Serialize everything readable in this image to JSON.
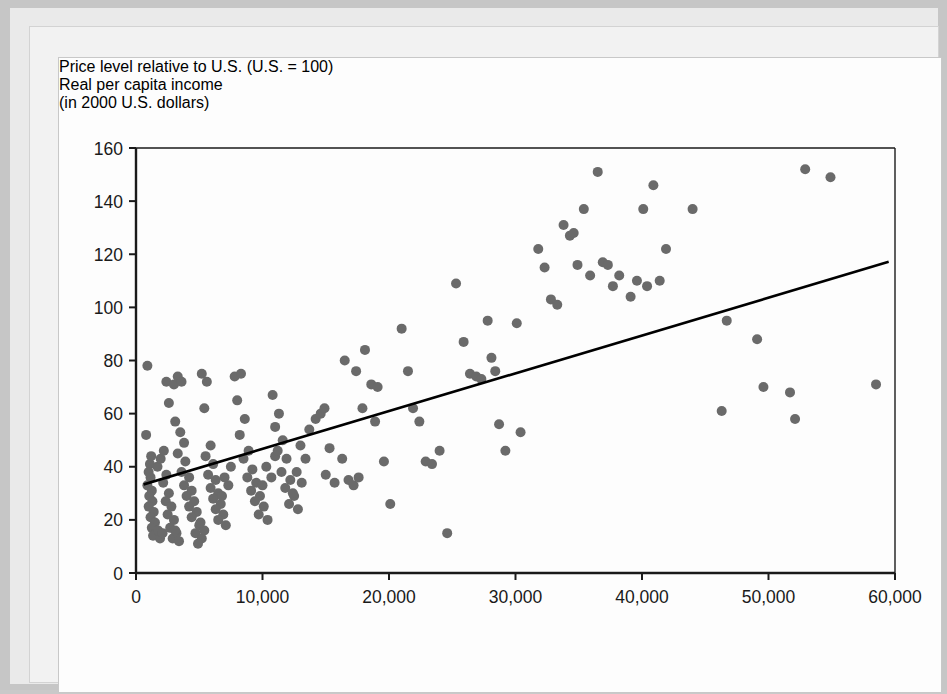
{
  "figure": {
    "y_axis_title": "Price level relative to U.S. (U.S. = 100)",
    "x_axis_title_line1": "Real per capita income",
    "x_axis_title_line2": "(in 2000 U.S. dollars)"
  },
  "colors": {
    "point_fill": "#6a6a6a",
    "axis": "#1a1a1a",
    "trendline": "#000000",
    "panel_background": "#fdfdfd",
    "mat_background": "#eaeaea",
    "outer_background": "#c6c6c6"
  },
  "chart_data": {
    "type": "scatter",
    "title": "",
    "subtitle": "",
    "xlabel": "Real per capita income (in 2000 U.S. dollars)",
    "ylabel": "Price level relative to U.S. (U.S. = 100)",
    "xlim": [
      0,
      60000
    ],
    "ylim": [
      0,
      160
    ],
    "xticks": [
      0,
      10000,
      20000,
      30000,
      40000,
      50000,
      60000
    ],
    "xtick_labels": [
      "0",
      "10,000",
      "20,000",
      "30,000",
      "40,000",
      "50,000",
      "60,000"
    ],
    "yticks": [
      0,
      20,
      40,
      60,
      80,
      100,
      120,
      140,
      160
    ],
    "ytick_labels": [
      "0",
      "20",
      "40",
      "60",
      "80",
      "100",
      "120",
      "140",
      "160"
    ],
    "grid": false,
    "legend": null,
    "marker": {
      "shape": "circle",
      "size_px": 10,
      "color": "#6a6a6a"
    },
    "trendline": {
      "type": "linear",
      "x": [
        700,
        59400
      ],
      "y": [
        33.5,
        117.0
      ],
      "color": "#000000",
      "width_px": 2.6
    },
    "points": [
      [
        900,
        78
      ],
      [
        800,
        52
      ],
      [
        1100,
        41
      ],
      [
        1200,
        44
      ],
      [
        1000,
        38
      ],
      [
        1150,
        36
      ],
      [
        900,
        33
      ],
      [
        1250,
        31
      ],
      [
        1050,
        29
      ],
      [
        1300,
        27
      ],
      [
        1000,
        25
      ],
      [
        1400,
        23
      ],
      [
        1150,
        21
      ],
      [
        1500,
        19
      ],
      [
        1250,
        17
      ],
      [
        1600,
        15
      ],
      [
        1350,
        14
      ],
      [
        1750,
        16
      ],
      [
        1900,
        13
      ],
      [
        2100,
        15
      ],
      [
        1700,
        40
      ],
      [
        1950,
        43
      ],
      [
        2200,
        46
      ],
      [
        2400,
        37
      ],
      [
        2150,
        34
      ],
      [
        2600,
        30
      ],
      [
        2350,
        27
      ],
      [
        2800,
        25
      ],
      [
        2500,
        22
      ],
      [
        3000,
        20
      ],
      [
        2700,
        17
      ],
      [
        3200,
        15
      ],
      [
        2900,
        13
      ],
      [
        3400,
        12
      ],
      [
        3100,
        16
      ],
      [
        2600,
        64
      ],
      [
        2400,
        72
      ],
      [
        3000,
        71
      ],
      [
        3300,
        74
      ],
      [
        3600,
        72
      ],
      [
        3100,
        57
      ],
      [
        3500,
        53
      ],
      [
        3800,
        49
      ],
      [
        3300,
        45
      ],
      [
        3900,
        42
      ],
      [
        3600,
        38
      ],
      [
        4200,
        36
      ],
      [
        3800,
        33
      ],
      [
        4400,
        31
      ],
      [
        4000,
        29
      ],
      [
        4600,
        27
      ],
      [
        4200,
        25
      ],
      [
        4800,
        23
      ],
      [
        4400,
        21
      ],
      [
        5000,
        18
      ],
      [
        4700,
        15
      ],
      [
        5200,
        13
      ],
      [
        4900,
        11
      ],
      [
        5400,
        16
      ],
      [
        5100,
        19
      ],
      [
        5200,
        75
      ],
      [
        5600,
        72
      ],
      [
        5400,
        62
      ],
      [
        5900,
        48
      ],
      [
        5500,
        44
      ],
      [
        6100,
        41
      ],
      [
        5700,
        37
      ],
      [
        6300,
        35
      ],
      [
        5900,
        32
      ],
      [
        6500,
        30
      ],
      [
        6100,
        28
      ],
      [
        6700,
        26
      ],
      [
        6300,
        24
      ],
      [
        6900,
        22
      ],
      [
        6500,
        20
      ],
      [
        7100,
        18
      ],
      [
        6800,
        29
      ],
      [
        7300,
        33
      ],
      [
        7000,
        36
      ],
      [
        7500,
        40
      ],
      [
        7800,
        74
      ],
      [
        8300,
        75
      ],
      [
        8000,
        65
      ],
      [
        8600,
        58
      ],
      [
        8200,
        52
      ],
      [
        8900,
        46
      ],
      [
        8500,
        43
      ],
      [
        9200,
        39
      ],
      [
        8800,
        36
      ],
      [
        9500,
        34
      ],
      [
        9100,
        31
      ],
      [
        9800,
        29
      ],
      [
        9400,
        27
      ],
      [
        10100,
        25
      ],
      [
        9700,
        22
      ],
      [
        10400,
        20
      ],
      [
        10000,
        33
      ],
      [
        10700,
        36
      ],
      [
        10300,
        40
      ],
      [
        11000,
        44
      ],
      [
        10800,
        67
      ],
      [
        11300,
        60
      ],
      [
        11000,
        55
      ],
      [
        11600,
        50
      ],
      [
        11200,
        46
      ],
      [
        11900,
        43
      ],
      [
        11500,
        38
      ],
      [
        12200,
        35
      ],
      [
        11800,
        32
      ],
      [
        12500,
        29
      ],
      [
        12100,
        26
      ],
      [
        12800,
        24
      ],
      [
        12400,
        30
      ],
      [
        13100,
        34
      ],
      [
        12700,
        38
      ],
      [
        13400,
        43
      ],
      [
        13000,
        48
      ],
      [
        13700,
        54
      ],
      [
        14200,
        58
      ],
      [
        14600,
        60
      ],
      [
        14900,
        62
      ],
      [
        15300,
        47
      ],
      [
        15000,
        37
      ],
      [
        15700,
        34
      ],
      [
        16300,
        43
      ],
      [
        16800,
        35
      ],
      [
        17200,
        33
      ],
      [
        17600,
        36
      ],
      [
        16500,
        80
      ],
      [
        17400,
        76
      ],
      [
        18100,
        84
      ],
      [
        18600,
        71
      ],
      [
        19100,
        70
      ],
      [
        17900,
        62
      ],
      [
        18900,
        57
      ],
      [
        19600,
        42
      ],
      [
        20100,
        26
      ],
      [
        21000,
        92
      ],
      [
        21500,
        76
      ],
      [
        21900,
        62
      ],
      [
        22400,
        57
      ],
      [
        22900,
        42
      ],
      [
        23400,
        41
      ],
      [
        24000,
        46
      ],
      [
        24600,
        15
      ],
      [
        25300,
        109
      ],
      [
        25900,
        87
      ],
      [
        26400,
        75
      ],
      [
        26900,
        74
      ],
      [
        27300,
        73
      ],
      [
        27800,
        95
      ],
      [
        28100,
        81
      ],
      [
        28400,
        76
      ],
      [
        28700,
        56
      ],
      [
        29200,
        46
      ],
      [
        30100,
        94
      ],
      [
        30400,
        53
      ],
      [
        31800,
        122
      ],
      [
        32300,
        115
      ],
      [
        32800,
        103
      ],
      [
        33300,
        101
      ],
      [
        33800,
        131
      ],
      [
        34300,
        127
      ],
      [
        34600,
        128
      ],
      [
        34900,
        116
      ],
      [
        35400,
        137
      ],
      [
        35900,
        112
      ],
      [
        36500,
        151
      ],
      [
        36900,
        117
      ],
      [
        37300,
        116
      ],
      [
        37700,
        108
      ],
      [
        38200,
        112
      ],
      [
        39100,
        104
      ],
      [
        39600,
        110
      ],
      [
        40100,
        137
      ],
      [
        40400,
        108
      ],
      [
        40900,
        146
      ],
      [
        41400,
        110
      ],
      [
        41900,
        122
      ],
      [
        44000,
        137
      ],
      [
        46300,
        61
      ],
      [
        46700,
        95
      ],
      [
        49100,
        88
      ],
      [
        49600,
        70
      ],
      [
        51700,
        68
      ],
      [
        52100,
        58
      ],
      [
        52900,
        152
      ],
      [
        54900,
        149
      ],
      [
        58500,
        71
      ]
    ]
  }
}
